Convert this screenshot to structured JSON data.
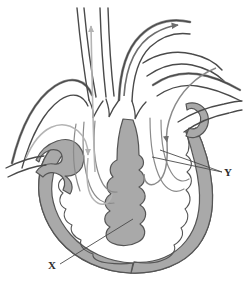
{
  "figure": {
    "type": "anatomical-diagram",
    "background_color": "#ffffff"
  },
  "colors": {
    "wall_fill": "#a9a9a9",
    "wall_outline": "#555555",
    "vessel_outline": "#4a4a4a",
    "vessel_fill": "#ffffff",
    "arrow_dark": "#6e6e6e",
    "arrow_light": "#b4b4b4",
    "leader_line": "#4a4a4a",
    "label_color": "#2b2b2b"
  },
  "labels": [
    {
      "id": "label-x",
      "text": "X",
      "x": 52,
      "y": 269,
      "leader_from": [
        60,
        264
      ],
      "leader_to": [
        133,
        219
      ]
    },
    {
      "id": "label-y",
      "text": "Y",
      "x": 228,
      "y": 176,
      "leader_from": [
        222,
        172
      ],
      "leader_to": [
        152,
        157
      ]
    }
  ],
  "structures": [
    {
      "id": "aorta",
      "name": "aorta",
      "side": "center-right"
    },
    {
      "id": "superior-vena-cava",
      "name": "superior vena cava",
      "side": "left"
    },
    {
      "id": "pulmonary-artery",
      "name": "pulmonary artery",
      "side": "center"
    },
    {
      "id": "pulmonary-veins",
      "name": "pulmonary veins",
      "side": "right"
    },
    {
      "id": "right-atrium",
      "name": "right atrium",
      "side": "left"
    },
    {
      "id": "left-atrium",
      "name": "left atrium",
      "side": "right"
    },
    {
      "id": "right-ventricle",
      "name": "right ventricle",
      "side": "left"
    },
    {
      "id": "left-ventricle",
      "name": "left ventricle",
      "side": "right"
    },
    {
      "id": "interventricular-septum",
      "name": "interventricular septum",
      "side": "center"
    },
    {
      "id": "semilunar-valves",
      "name": "semilunar valves",
      "side": "center"
    }
  ],
  "flow_arrows": [
    {
      "id": "arrow-up-pulmonary",
      "direction": "up",
      "tone": "light",
      "note": "flow out through pulmonary trunk"
    },
    {
      "id": "arrow-out-aorta",
      "direction": "up-right",
      "tone": "dark",
      "note": "flow out through aortic arch"
    },
    {
      "id": "arrow-in-vena-cava",
      "direction": "down-right",
      "tone": "light",
      "note": "flow into right atrium"
    },
    {
      "id": "arrow-in-pulmonary-vein",
      "direction": "down",
      "tone": "dark",
      "note": "flow into left ventricle"
    }
  ]
}
